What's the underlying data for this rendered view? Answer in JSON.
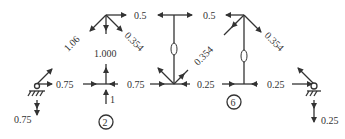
{
  "diagram": {
    "type": "truss free-body diagram (method of joints)",
    "colors": {
      "line": "#333333",
      "text": "#333333",
      "background": "#ffffff"
    },
    "nodes": {
      "A": {
        "x": 37,
        "y": 84,
        "support": "pin"
      },
      "B": {
        "x": 106,
        "y": 84
      },
      "C": {
        "x": 174,
        "y": 84
      },
      "D": {
        "x": 244,
        "y": 84
      },
      "E": {
        "x": 314,
        "y": 84,
        "support": "roller"
      },
      "F": {
        "x": 106,
        "y": 15
      },
      "G": {
        "x": 174,
        "y": 15
      },
      "H": {
        "x": 244,
        "y": 15
      }
    },
    "member_labels": {
      "af": "1.06",
      "bf": "1.000",
      "fg": "0.5",
      "gh": "0.5",
      "fc": "0.354",
      "hc": "0.354",
      "he": "0.354",
      "gc": "0",
      "hd": "0",
      "ab": "0.75",
      "bc": "0.75",
      "cd": "0.25",
      "de": "0.25"
    },
    "loads": {
      "b_load": "1"
    },
    "reactions": {
      "left": "0.75",
      "right": "0.25"
    },
    "circled_labels": {
      "node_2": "2",
      "node_6": "6"
    }
  }
}
